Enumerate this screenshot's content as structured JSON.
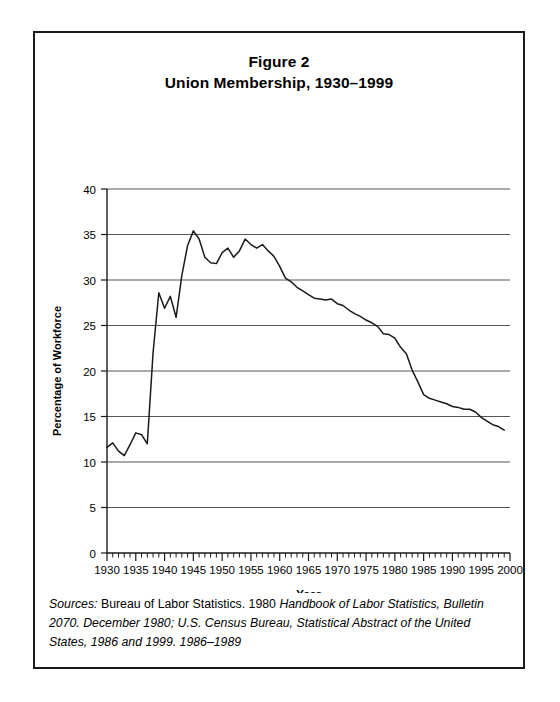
{
  "figure": {
    "title_line_1": "Figure 2",
    "title_line_2": "Union Membership, 1930–1999",
    "border_color": "#1a1a1a",
    "background": "#ffffff"
  },
  "source": {
    "label": "Sources:",
    "part_roman_1": " Bureau of Labor Statistics. 1980 ",
    "part_italic_1": "Handbook of Labor Statistics, Bulletin 2070. December 1980; U.S. Census Bureau, Statistical Abstract of the United States, 1986 and 1999. 1986–1989"
  },
  "chart_data": {
    "type": "line",
    "title": "Union Membership, 1930–1999",
    "subtitle": "Figure 2",
    "xlabel": "Year",
    "ylabel": "Percentage of Workforce",
    "xlim": [
      1930,
      2000
    ],
    "ylim": [
      0,
      40
    ],
    "ytick_step": 5,
    "xtick_major_step": 5,
    "xtick_minor_step": 1,
    "grid": "horizontal",
    "legend": "none",
    "line_color": "#1a1a1a",
    "gridline_color": "#555555",
    "ytick_labels": [
      "0",
      "5",
      "10",
      "15",
      "20",
      "25",
      "30",
      "35",
      "40"
    ],
    "ytick_values": [
      0,
      5,
      10,
      15,
      20,
      25,
      30,
      35,
      40
    ],
    "xtick_labels": [
      "1930",
      "1935",
      "1940",
      "1945",
      "1950",
      "1955",
      "1960",
      "1965",
      "1970",
      "1975",
      "1980",
      "1985",
      "1990",
      "1995",
      "2000"
    ],
    "xtick_values": [
      1930,
      1935,
      1940,
      1945,
      1950,
      1955,
      1960,
      1965,
      1970,
      1975,
      1980,
      1985,
      1990,
      1995,
      2000
    ],
    "series": [
      {
        "name": "Union Membership",
        "x": [
          1930,
          1931,
          1932,
          1933,
          1934,
          1935,
          1936,
          1937,
          1938,
          1939,
          1940,
          1941,
          1942,
          1943,
          1944,
          1945,
          1946,
          1947,
          1948,
          1949,
          1950,
          1951,
          1952,
          1953,
          1954,
          1955,
          1956,
          1957,
          1958,
          1959,
          1960,
          1961,
          1962,
          1963,
          1964,
          1965,
          1966,
          1967,
          1968,
          1969,
          1970,
          1971,
          1972,
          1973,
          1974,
          1975,
          1976,
          1977,
          1978,
          1979,
          1980,
          1981,
          1982,
          1983,
          1984,
          1985,
          1986,
          1987,
          1988,
          1989,
          1990,
          1991,
          1992,
          1993,
          1994,
          1995,
          1996,
          1997,
          1998,
          1999
        ],
        "values": [
          11.6,
          12.1,
          11.2,
          10.7,
          11.9,
          13.2,
          13.0,
          12.0,
          22.0,
          28.6,
          26.9,
          28.2,
          25.9,
          30.5,
          33.8,
          35.4,
          34.5,
          32.5,
          31.9,
          31.8,
          33.0,
          33.5,
          32.5,
          33.2,
          34.5,
          33.9,
          33.5,
          33.9,
          33.2,
          32.6,
          31.5,
          30.2,
          29.8,
          29.2,
          28.8,
          28.4,
          28.0,
          27.9,
          27.8,
          27.9,
          27.4,
          27.2,
          26.7,
          26.3,
          26.0,
          25.6,
          25.3,
          24.9,
          24.1,
          24.0,
          23.6,
          22.6,
          21.9,
          20.1,
          18.8,
          17.4,
          17.0,
          16.8,
          16.6,
          16.4,
          16.1,
          16.0,
          15.8,
          15.8,
          15.5,
          14.9,
          14.5,
          14.1,
          13.9,
          13.5
        ]
      }
    ]
  }
}
